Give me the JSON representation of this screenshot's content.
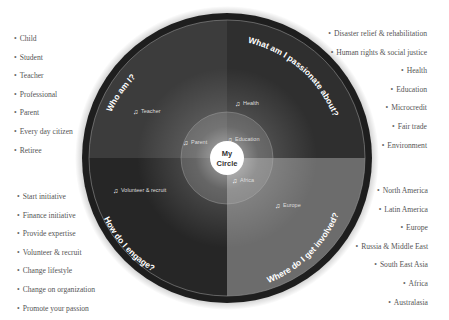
{
  "diagram": {
    "title": "My Circle",
    "center": {
      "line1": "My",
      "line2": "Circle"
    },
    "quadrants": [
      {
        "id": "who",
        "heading": "Who am I?",
        "marker_label": "Teacher",
        "inner_marker_label": "Parent",
        "color": "#3a3a3a"
      },
      {
        "id": "passion",
        "heading": "What am I passionate about?",
        "marker_label": "Health",
        "inner_marker_label": "Education",
        "color": "#303030"
      },
      {
        "id": "engage",
        "heading": "How do I engage?",
        "marker_label": "Volunteer & recruit",
        "inner_marker_label": "",
        "color": "#2a2a2a"
      },
      {
        "id": "where",
        "heading": "Where do I get involved?",
        "marker_label": "Europe",
        "inner_marker_label": "Africa",
        "color": "#6e6e6e"
      }
    ],
    "lists": {
      "who": [
        "Child",
        "Student",
        "Teacher",
        "Professional",
        "Parent",
        "Every day citizen",
        "Retiree"
      ],
      "passion": [
        "Disaster relief & rehabilitation",
        "Human rights & social justice",
        "Health",
        "Education",
        "Microcredit",
        "Fair trade",
        "Environment"
      ],
      "engage": [
        "Start initiative",
        "Finance initiative",
        "Provide expertise",
        "Volunteer & recruit",
        "Change lifestyle",
        "Change on organization",
        "Promote your passion"
      ],
      "where": [
        "North America",
        "Latin America",
        "Europe",
        "Russia & Middle East",
        "South East Asia",
        "Africa",
        "Australasia"
      ]
    },
    "marker_icon": "person-marker-icon"
  }
}
